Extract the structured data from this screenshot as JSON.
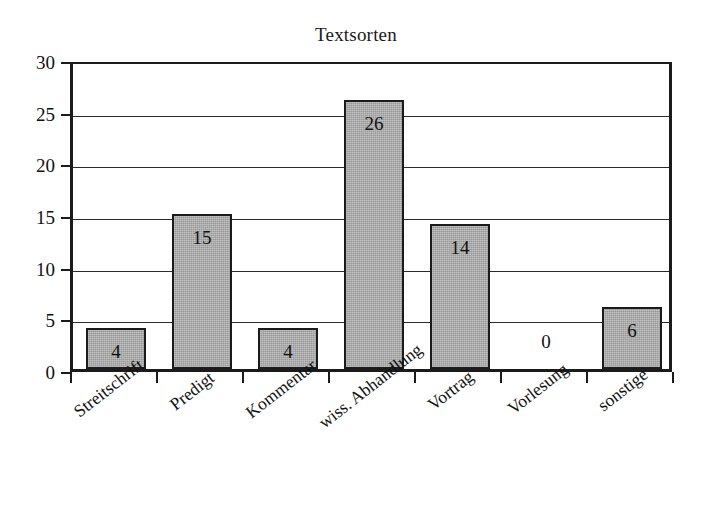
{
  "chart_data": {
    "type": "bar",
    "title": "Textsorten",
    "xlabel": "",
    "ylabel": "",
    "categories": [
      "Streitschrift",
      "Predigt",
      "Kommentar",
      "wiss. Abhandlung",
      "Vortrag",
      "Vorlesung",
      "sonstige"
    ],
    "values": [
      4,
      15,
      4,
      26,
      14,
      0,
      6
    ],
    "value_labels": [
      "4",
      "15",
      "4",
      "26",
      "14",
      "0",
      "6"
    ],
    "ylim": [
      0,
      30
    ],
    "ytick_labels": [
      "0",
      "5",
      "10",
      "15",
      "20",
      "25",
      "30"
    ],
    "ytick_values": [
      0,
      5,
      10,
      15,
      20,
      25,
      30
    ],
    "grid": true,
    "legend": false,
    "bar_fill_color": "#a9a9a9",
    "bar_edge_color": "#1b1b1b",
    "axis_color": "#1b1b1b",
    "background_color": "#ffffff",
    "text_color": "#111111"
  }
}
